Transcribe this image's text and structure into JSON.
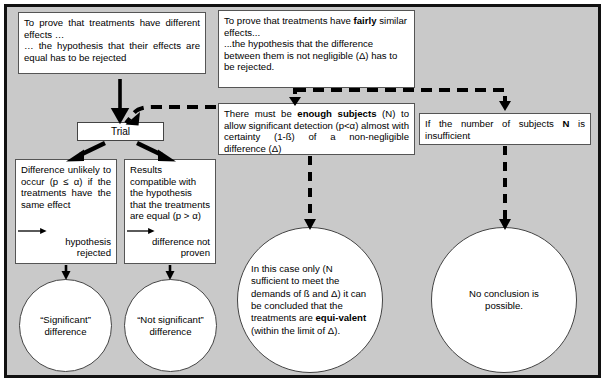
{
  "diagram": {
    "background_color": "#c9c9c9",
    "frame_color": "#111111",
    "box_fill": "#ffffff"
  },
  "boxes": {
    "prove_different": {
      "line1": "To prove that treatments have different effects …",
      "line2": "… the hypothesis that their effects are equal has to be rejected"
    },
    "prove_similar": {
      "line1_a": "To prove that treatments have ",
      "line1_bold": "fairly",
      "line1_b": " similar effects...",
      "line2": "...the hypothesis that the difference between them is not negligible (Δ) has to be rejected."
    },
    "enough_subjects": {
      "text_a": "There must be ",
      "bold": "enough subjects",
      "text_b": " (N) to allow significant detection (p<α) almost with certainty (1-ß) of a non-negligible difference (Δ)"
    },
    "insufficient": {
      "text_a": "If the number of subjects ",
      "bold": "N",
      "text_b": " is insufficient"
    },
    "trial": {
      "label": "Trial"
    },
    "difference_unlikely": {
      "text": "Difference unlikely to occur (p ≤ α) if the treatments have the same effect",
      "outcome_line1": "hypothesis",
      "outcome_line2": "rejected"
    },
    "results_compatible": {
      "text": "Results compatible with the hypothesis that the treatments are equal (p > α)",
      "outcome_line1": "difference not",
      "outcome_line2": "proven"
    }
  },
  "circles": {
    "significant": {
      "line1": "“Significant”",
      "line2": "difference"
    },
    "not_significant": {
      "line1": "“Not significant”",
      "line2": "difference"
    },
    "equivalent": {
      "text_a": "In this case only (N sufficient to meet the demands of ß and Δ) it can be concluded that the treatments are ",
      "bold": "equi-valent",
      "text_b": " (within the limit of Δ)."
    },
    "no_conclusion": {
      "line1": "No conclusion is",
      "line2": "possible."
    }
  },
  "connectors": {
    "solid_down_to_trial": "solid-arrow-down",
    "dashed_to_trial": "dashed-arrow-elbow-left",
    "similar_to_enough": "dashed-arrow-down",
    "similar_to_insufficient": "dashed-arrow-elbow-right",
    "trial_split_left": "solid-arrow-diagonal-left",
    "trial_split_right": "solid-arrow-diagonal-right",
    "enough_to_equivalent": "dashed-arrow-down",
    "insufficient_to_noconclusion": "dashed-arrow-down",
    "rejected_to_significant": "solid-arrow-down",
    "proven_to_notsignificant": "solid-arrow-down",
    "inline_rejected": "solid-arrow-right",
    "inline_proven": "solid-arrow-right"
  }
}
